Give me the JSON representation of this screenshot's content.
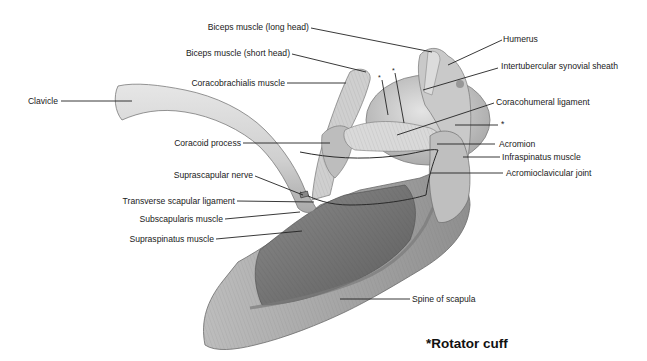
{
  "figure": {
    "type": "anatomical illustration",
    "colors": {
      "background": "#ffffff",
      "text": "#1a1a1a",
      "leader_line": "#222222",
      "illustration_tone": "#9a9a9a"
    }
  },
  "labels": {
    "biceps_long": "Biceps muscle (long head)",
    "biceps_short": "Biceps muscle (short head)",
    "humerus": "Humerus",
    "coracobrachialis": "Coracobrachialis muscle",
    "intertubercular": "Intertubercular synovial sheath",
    "clavicle": "Clavicle",
    "coracohumeral": "Coracohumeral ligament",
    "asterisk_right": "*",
    "acromion": "Acromion",
    "coracoid": "Coracoid process",
    "infraspinatus": "Infraspinatus muscle",
    "acromioclavicular": "Acromioclavicular joint",
    "suprascapular_nerve": "Suprascapular nerve",
    "transverse_ligament": "Transverse scapular ligament",
    "subscapularis": "Subscapularis muscle",
    "supraspinatus": "Supraspinatus muscle",
    "spine_scapula": "Spine of scapula",
    "asterisk_a": "*",
    "asterisk_b": "*"
  },
  "legend": {
    "caption": "*Rotator cuff"
  }
}
